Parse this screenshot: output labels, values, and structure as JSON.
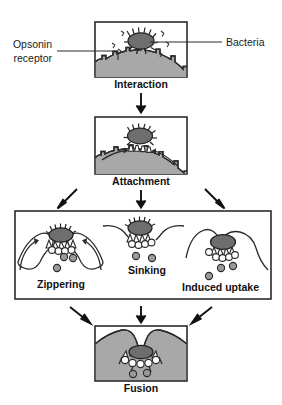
{
  "figure": {
    "background_color": "#ffffff"
  },
  "annotations": {
    "left_label_line1": "Opsonin",
    "left_label_line2": "receptor",
    "right_label": "Bacteria"
  },
  "panels": [
    {
      "id": "interaction",
      "caption": "Interaction",
      "contents": [
        "bacteria",
        "opsonin-molecules",
        "phagocyte-surface",
        "opsonin-receptors"
      ]
    },
    {
      "id": "attachment",
      "caption": "Attachment",
      "contents": [
        "bacteria-bound",
        "receptor-clustering",
        "membrane"
      ]
    },
    {
      "id": "mechanisms",
      "caption": "",
      "sub_labels": [
        "Zippering",
        "Sinking",
        "Induced uptake"
      ],
      "contents": [
        "pseudopods",
        "granules",
        "bacteria"
      ]
    },
    {
      "id": "fusion",
      "caption": "Fusion",
      "contents": [
        "phagosome",
        "granules",
        "bacteria-internalized"
      ]
    }
  ],
  "colors": {
    "panel_border": "#2b2b2b",
    "panel_fill": "#ffffff",
    "cytoplasm": "#a8a8a8",
    "bacteria": "#6e6e6e",
    "granule": "#9a9a9a",
    "receptor": "#ffffff",
    "text": "#111111",
    "arrow": "#111111"
  },
  "icons": {
    "down_arrow": "arrow-down-icon",
    "diagonal_left_arrow": "arrow-diagonal-left-icon",
    "diagonal_right_arrow": "arrow-diagonal-right-icon"
  }
}
